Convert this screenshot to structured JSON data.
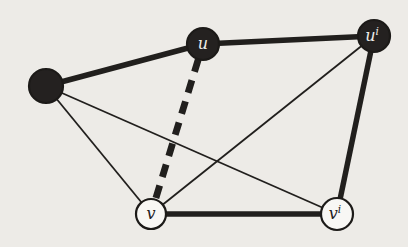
{
  "figure": {
    "background_color": "#edebe7",
    "ink_color": "#211f1d",
    "nodes": [
      {
        "id": "w",
        "label": "",
        "sup": "",
        "x": 46,
        "y": 86,
        "r": 17,
        "type": "filled"
      },
      {
        "id": "u",
        "label": "u",
        "sup": "",
        "x": 203,
        "y": 44,
        "r": 16,
        "type": "filled"
      },
      {
        "id": "ui",
        "label": "u",
        "sup": "i",
        "x": 374,
        "y": 36,
        "r": 16,
        "type": "filled"
      },
      {
        "id": "v",
        "label": "v",
        "sup": "",
        "x": 151,
        "y": 214,
        "r": 15,
        "type": "open"
      },
      {
        "id": "vi",
        "label": "v",
        "sup": "i",
        "x": 337,
        "y": 214,
        "r": 16,
        "type": "open"
      }
    ],
    "edges": [
      {
        "from": "w",
        "to": "u",
        "style": "thick"
      },
      {
        "from": "u",
        "to": "ui",
        "style": "thick"
      },
      {
        "from": "ui",
        "to": "vi",
        "style": "thick"
      },
      {
        "from": "v",
        "to": "vi",
        "style": "thick"
      },
      {
        "from": "w",
        "to": "v",
        "style": "thin"
      },
      {
        "from": "w",
        "to": "vi",
        "style": "thin"
      },
      {
        "from": "ui",
        "to": "v",
        "style": "thin"
      },
      {
        "from": "u",
        "to": "v",
        "style": "dashed"
      }
    ],
    "styles": {
      "thick_width": 5.5,
      "thin_width": 1.8,
      "dashed_width": 6.8,
      "dash_pattern": "13 9",
      "dash_offset": 6,
      "node_fill_dark": "#242120",
      "node_fill_open": "#f8f7f4",
      "node_stroke": "#1c1a18",
      "node_stroke_width": 2.2,
      "label_color_on_dark": "#efede9",
      "label_color_on_open": "#22201e",
      "label_size": 16,
      "sup_size": 10.5
    }
  }
}
